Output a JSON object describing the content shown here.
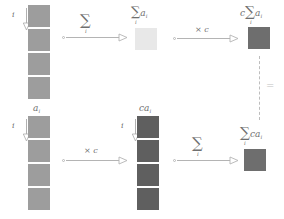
{
  "figure": {
    "colors": {
      "cell_light": "#e8e8e8",
      "cell_medium": "#9d9d9d",
      "cell_dark": "#6e6e6e",
      "cell_darker": "#5f5f5f",
      "border": "#ffffff",
      "arrow": "#b4b4b4",
      "text": "#6f6f6f",
      "dash": "#bdbdbd",
      "background": "#ffffff"
    },
    "index_label": "i",
    "equals_sign": "=",
    "sum_symbol": "∑",
    "times_symbol": "×"
  },
  "nodes": {
    "top_left_column": {
      "name": "input-array-top",
      "label": "",
      "index_label": "i",
      "cell_count": 4,
      "cell_color": "#9d9d9d",
      "cell_size": 22
    },
    "top_sum_result": {
      "name": "sum-result",
      "label_sum": "∑",
      "label_sub": "i",
      "label_term": "a",
      "label_term_sub": "i",
      "label_full": "∑ᵢ aᵢ",
      "cell_count": 1,
      "cell_color": "#e8e8e8",
      "cell_size": 22
    },
    "top_right_result": {
      "name": "scaled-sum-result",
      "label_coef": "c",
      "label_sum": "∑",
      "label_sub": "i",
      "label_term": "a",
      "label_term_sub": "i",
      "label_full": "c ∑ᵢ aᵢ",
      "cell_count": 1,
      "cell_color": "#6e6e6e",
      "cell_size": 22
    },
    "bottom_left_column": {
      "name": "input-array-bottom",
      "label_term": "a",
      "label_term_sub": "i",
      "label_full": "aᵢ",
      "index_label": "i",
      "cell_count": 4,
      "cell_color": "#9d9d9d",
      "cell_size": 22
    },
    "bottom_middle_column": {
      "name": "scaled-array",
      "label_coef": "c",
      "label_term": "a",
      "label_term_sub": "i",
      "label_full": "caᵢ",
      "index_label": "i",
      "cell_count": 4,
      "cell_color": "#5f5f5f",
      "cell_size": 22
    },
    "bottom_right_result": {
      "name": "sum-of-scaled-result",
      "label_sum": "∑",
      "label_sub": "i",
      "label_coef": "c",
      "label_term": "a",
      "label_term_sub": "i",
      "label_full": "∑ᵢ caᵢ",
      "cell_count": 1,
      "cell_color": "#6e6e6e",
      "cell_size": 22
    }
  },
  "arrows": {
    "top_sum": {
      "name": "sum-arrow-top",
      "label_main": "∑",
      "label_sub": "i"
    },
    "top_scale": {
      "name": "scale-arrow-top",
      "label_times": "×",
      "label_coef": "c",
      "label_full": "× c"
    },
    "bottom_scale": {
      "name": "scale-arrow-bottom",
      "label_times": "×",
      "label_coef": "c",
      "label_full": "× c"
    },
    "bottom_sum": {
      "name": "sum-arrow-bottom",
      "label_main": "∑",
      "label_sub": "i"
    }
  }
}
